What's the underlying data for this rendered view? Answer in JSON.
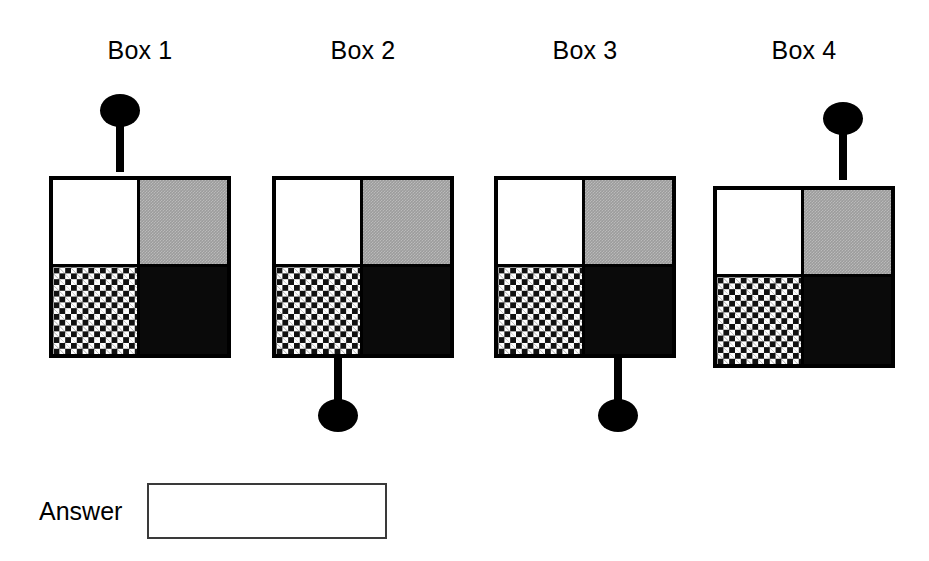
{
  "page": {
    "background": "#ffffff",
    "ink": "#000000"
  },
  "boxes": [
    {
      "title": "Box 1",
      "knob": {
        "position": "top",
        "side": "left"
      },
      "quadrants": {
        "top_left": "white",
        "top_right": "gray-dither",
        "bottom_left": "checkerboard",
        "bottom_right": "black"
      }
    },
    {
      "title": "Box 2",
      "knob": {
        "position": "bottom",
        "side": "left"
      },
      "quadrants": {
        "top_left": "white",
        "top_right": "gray-dither",
        "bottom_left": "checkerboard",
        "bottom_right": "black"
      }
    },
    {
      "title": "Box 3",
      "knob": {
        "position": "bottom",
        "side": "right"
      },
      "quadrants": {
        "top_left": "white",
        "top_right": "gray-dither",
        "bottom_left": "checkerboard",
        "bottom_right": "black"
      }
    },
    {
      "title": "Box 4",
      "knob": {
        "position": "top",
        "side": "right"
      },
      "quadrants": {
        "top_left": "white",
        "top_right": "gray-dither",
        "bottom_left": "checkerboard",
        "bottom_right": "black"
      }
    }
  ],
  "answer": {
    "label": "Answer",
    "value": "",
    "placeholder": ""
  },
  "colors": {
    "outline": "#000000",
    "gray_fill": "#9c9c9c",
    "black_fill": "#0a0a0a",
    "white_fill": "#ffffff",
    "answer_border": "#3a3a3a"
  }
}
